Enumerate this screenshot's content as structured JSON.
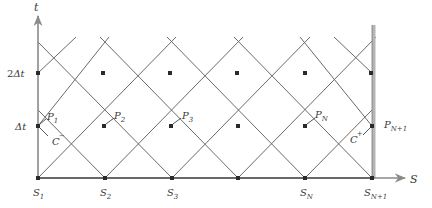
{
  "diagram": {
    "colors": {
      "grid_line": "#6a6a6a",
      "axis": "#8a8a8a",
      "node": "#2a2a2a",
      "boundary": "#b5b5b5",
      "text": "#3a3a3a"
    },
    "axes": {
      "t_label": "t",
      "s_label": "S",
      "t_ticks": [
        {
          "main": "Δt",
          "prefix": ""
        },
        {
          "main": "Δt",
          "prefix": "2"
        }
      ]
    },
    "s_labels": [
      {
        "base": "S",
        "sub": "1"
      },
      {
        "base": "S",
        "sub": "2"
      },
      {
        "base": "S",
        "sub": "3"
      },
      {
        "base": "S",
        "sub": "N"
      },
      {
        "base": "S",
        "sub": "N+1"
      }
    ],
    "p_labels": [
      {
        "base": "P",
        "sub": "1"
      },
      {
        "base": "P",
        "sub": "2"
      },
      {
        "base": "P",
        "sub": "3"
      },
      {
        "base": "P",
        "sub": "N"
      },
      {
        "base": "P",
        "sub": "N+1"
      }
    ],
    "characteristics": [
      {
        "base": "C",
        "sup": "−"
      },
      {
        "base": "C",
        "sup": "+"
      }
    ]
  }
}
